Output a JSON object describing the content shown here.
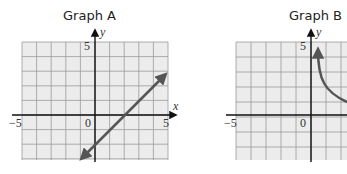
{
  "chart_data": [
    {
      "type": "line",
      "title": "Graph A",
      "xlabel": "x",
      "ylabel": "y",
      "xlim": [
        -5,
        5
      ],
      "ylim": [
        -3,
        5
      ],
      "grid": true,
      "tick_labels": {
        "x_left": "−5",
        "origin": "0",
        "x_right": "5",
        "y_top": "5"
      },
      "series": [
        {
          "name": "line",
          "x": [
            -1,
            5
          ],
          "y": [
            -3,
            3
          ],
          "arrows": "both",
          "equation": "y = x - 2"
        }
      ],
      "color": "#555555"
    },
    {
      "type": "line",
      "title": "Graph B",
      "xlabel": "x",
      "ylabel": "y",
      "xlim": [
        -5,
        2.3
      ],
      "ylim": [
        -3,
        5
      ],
      "grid": true,
      "tick_labels": {
        "x_left": "−5",
        "origin": "0",
        "y_top": "5"
      },
      "series": [
        {
          "name": "curve",
          "x": [
            0.5,
            0.6,
            0.8,
            1.0,
            1.3,
            1.7,
            2.2
          ],
          "y": [
            4.5,
            3.4,
            2.5,
            2.0,
            1.55,
            1.2,
            0.9
          ],
          "arrows": "start"
        }
      ],
      "color": "#555555",
      "note": "graph cropped at right edge of image"
    }
  ],
  "graphA": {
    "title": "Graph A",
    "x_left": "−5",
    "origin": "0",
    "x_right": "5",
    "y_top": "5",
    "xlabel": "x",
    "ylabel": "y"
  },
  "graphB": {
    "title": "Graph B",
    "x_left": "−5",
    "origin": "0",
    "y_top": "5",
    "ylabel": "y"
  }
}
